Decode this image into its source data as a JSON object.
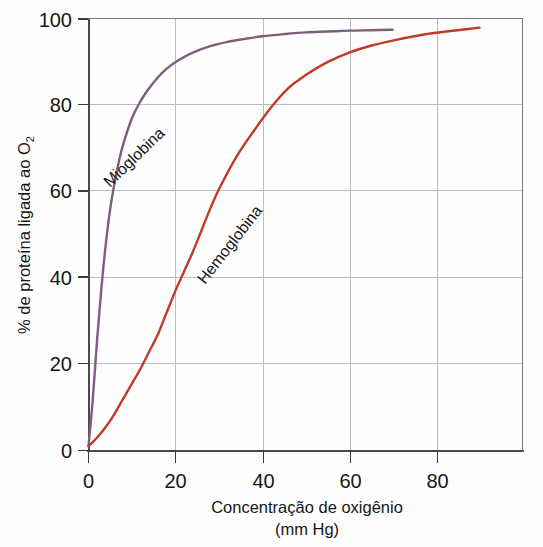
{
  "chart_data": {
    "type": "line",
    "title": "",
    "subtitle": "",
    "xlabel": "Concentração de oxigênio",
    "xlabel_units": "(mm Hg)",
    "ylabel": "% de proteína ligada ao O",
    "ylabel_sub": "2",
    "xlim": [
      0,
      100
    ],
    "ylim": [
      0,
      100
    ],
    "xticks": [
      0,
      20,
      40,
      60,
      80
    ],
    "yticks": [
      0,
      20,
      40,
      60,
      80,
      100
    ],
    "xtick_labels": [
      "0",
      "20",
      "40",
      "60",
      "80"
    ],
    "ytick_labels": [
      "0",
      "20",
      "40",
      "60",
      "80",
      "100"
    ],
    "grid": true,
    "grid_color": "#b9bec6",
    "legend": "inline-curve-labels",
    "series": [
      {
        "name": "Mioglobina",
        "color": "#7c5f7d",
        "label_angle": -44,
        "x": [
          0,
          1,
          2,
          3,
          4,
          5,
          6,
          7,
          8,
          10,
          12,
          14,
          16,
          18,
          20,
          24,
          28,
          32,
          36,
          40,
          45,
          50,
          55,
          60,
          65,
          70
        ],
        "y": [
          1,
          12,
          26,
          38,
          48,
          56,
          62,
          67,
          71,
          77,
          81,
          84,
          86.5,
          88.5,
          90,
          92.2,
          93.7,
          94.7,
          95.4,
          96,
          96.5,
          96.9,
          97.1,
          97.3,
          97.4,
          97.5
        ]
      },
      {
        "name": "Hemoglobina",
        "color": "#c03a28",
        "label_angle": -52,
        "x": [
          0,
          2,
          4,
          6,
          8,
          10,
          12,
          14,
          16,
          18,
          20,
          22,
          24,
          26,
          28,
          30,
          34,
          38,
          42,
          46,
          50,
          55,
          60,
          65,
          70,
          75,
          80,
          85,
          90
        ],
        "y": [
          1,
          3,
          5.5,
          8.5,
          12,
          15.5,
          19,
          23,
          27,
          32,
          37,
          41.5,
          46,
          51,
          56,
          60.5,
          68,
          74,
          79.5,
          84,
          87,
          90,
          92.2,
          93.8,
          95,
          96,
          96.8,
          97.4,
          98
        ]
      }
    ]
  },
  "axes": {
    "x_label_line1": "Concentração de oxigênio",
    "x_label_line2": "(mm Hg)",
    "y_label_main": "% de proteína ligada ao O",
    "y_label_subscript": "2"
  },
  "labels": {
    "myoglobin": "Mioglobina",
    "hemoglobin": "Hemoglobina"
  },
  "ticks": {
    "x": [
      "0",
      "20",
      "40",
      "60",
      "80"
    ],
    "y": [
      "0",
      "20",
      "40",
      "60",
      "80",
      "100"
    ]
  },
  "colors": {
    "myoglobin": "#7c5f7d",
    "hemoglobin": "#c03a28",
    "axis": "#4a4a4a",
    "grid": "#b9bec6",
    "text": "#161616",
    "background": "#fefefe"
  }
}
